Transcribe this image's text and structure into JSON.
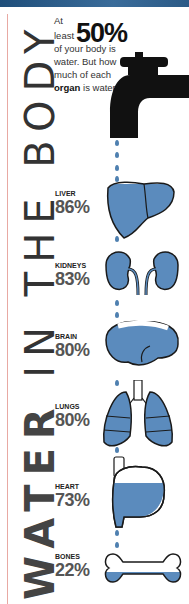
{
  "title": {
    "vertical_text_prefix": "WATER",
    "vertical_text_rest": " IN THE BODY"
  },
  "intro": {
    "line1": "At least",
    "highlight": "50%",
    "line2": "of your body is water. But how much of each",
    "bold_word": "organ",
    "line3": "is water?"
  },
  "organs": [
    {
      "name": "LIVER",
      "percent": "86%",
      "icon": "liver-icon"
    },
    {
      "name": "KIDNEYS",
      "percent": "83%",
      "icon": "kidneys-icon"
    },
    {
      "name": "BRAIN",
      "percent": "80%",
      "icon": "brain-icon"
    },
    {
      "name": "LUNGS",
      "percent": "80%",
      "icon": "lungs-icon"
    },
    {
      "name": "HEART",
      "percent": "73%",
      "icon": "heart-icon"
    },
    {
      "name": "BONES",
      "percent": "22%",
      "icon": "bone-icon"
    }
  ],
  "colors": {
    "water": "#5b8bbd",
    "outline": "#1a1a1a",
    "banner": "#2b5a86",
    "margin_line": "#e8a9a3"
  }
}
